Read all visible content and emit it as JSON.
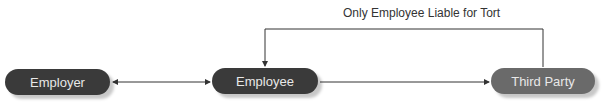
{
  "diagram": {
    "nodes": [
      {
        "id": "employer",
        "label": "Employer"
      },
      {
        "id": "employee",
        "label": "Employee"
      },
      {
        "id": "third_party",
        "label": "Third Party"
      }
    ],
    "edges": [
      {
        "from": "employer",
        "to": "employee",
        "type": "bidirectional"
      },
      {
        "from": "employee",
        "to": "third_party",
        "type": "directed"
      },
      {
        "from": "third_party",
        "to": "employee",
        "type": "directed",
        "label": "Only Employee Liable for Tort"
      }
    ],
    "annotation": "Only Employee Liable for Tort",
    "colors": {
      "dark_node": "#3a3a3a",
      "third_party_node": "#6a6a6a",
      "line": "#333333"
    }
  }
}
